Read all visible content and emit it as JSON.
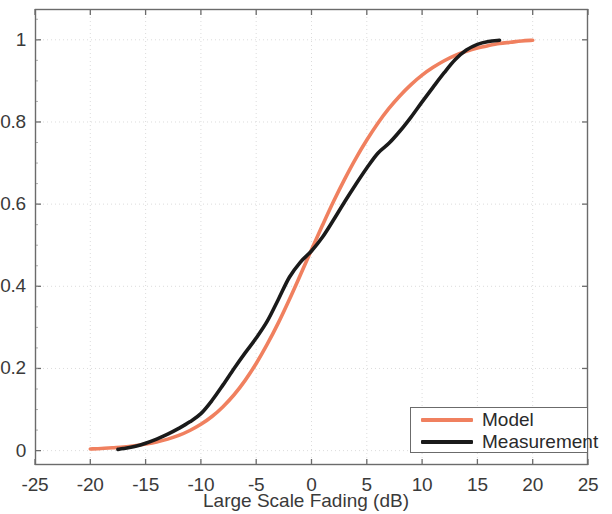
{
  "chart_data": {
    "type": "line",
    "title": "",
    "xlabel": "Large Scale Fading (dB)",
    "ylabel": "",
    "xlim": [
      -25,
      25
    ],
    "ylim": [
      -0.035,
      1.075
    ],
    "xticks": [
      -25,
      -20,
      -15,
      -10,
      -5,
      0,
      5,
      10,
      15,
      20,
      25
    ],
    "xtick_labels": [
      "-25",
      "-20",
      "-15",
      "-10",
      "-5",
      "0",
      "5",
      "10",
      "15",
      "20",
      "25"
    ],
    "yticks": [
      0,
      0.2,
      0.4,
      0.6,
      0.8,
      1
    ],
    "ytick_labels": [
      "0",
      "0.2",
      "0.4",
      "0.6",
      "0.8",
      "1"
    ],
    "grid": true,
    "grid_style": "dotted",
    "legend_position": "lower right",
    "series": [
      {
        "name": "Model",
        "color": "#f0805f",
        "width": 3.6,
        "x": [
          -20,
          -19,
          -18,
          -17,
          -16,
          -15,
          -14,
          -13,
          -12,
          -11,
          -10,
          -9,
          -8,
          -7,
          -6,
          -5,
          -4,
          -3,
          -2,
          -1,
          0,
          1,
          2,
          3,
          4,
          5,
          6,
          7,
          8,
          9,
          10,
          11,
          12,
          13,
          14,
          15,
          16,
          17,
          18,
          19,
          20
        ],
        "y": [
          0.004,
          0.005,
          0.007,
          0.009,
          0.012,
          0.016,
          0.021,
          0.028,
          0.037,
          0.049,
          0.064,
          0.083,
          0.107,
          0.136,
          0.171,
          0.212,
          0.259,
          0.311,
          0.368,
          0.428,
          0.489,
          0.549,
          0.607,
          0.661,
          0.711,
          0.756,
          0.797,
          0.833,
          0.864,
          0.891,
          0.914,
          0.933,
          0.949,
          0.962,
          0.972,
          0.98,
          0.986,
          0.991,
          0.994,
          0.997,
          0.999
        ]
      },
      {
        "name": "Measurement",
        "color": "#1a1a1a",
        "width": 3.6,
        "x": [
          -17.5,
          -17,
          -16,
          -15,
          -14,
          -13,
          -12,
          -11,
          -10,
          -9,
          -8,
          -7,
          -6,
          -5,
          -4,
          -3,
          -2,
          -1,
          0,
          1,
          2,
          3,
          4,
          5,
          6,
          7,
          8,
          9,
          10,
          11,
          12,
          13,
          14,
          15,
          16,
          17
        ],
        "y": [
          0.003,
          0.005,
          0.01,
          0.018,
          0.028,
          0.04,
          0.054,
          0.07,
          0.09,
          0.122,
          0.16,
          0.2,
          0.238,
          0.274,
          0.315,
          0.368,
          0.422,
          0.459,
          0.486,
          0.52,
          0.562,
          0.606,
          0.648,
          0.688,
          0.724,
          0.748,
          0.778,
          0.812,
          0.849,
          0.885,
          0.92,
          0.952,
          0.975,
          0.989,
          0.996,
          0.999
        ]
      }
    ]
  },
  "axes": {
    "xlabel": "Large Scale Fading (dB)",
    "xtick_labels": [
      "-25",
      "-20",
      "-15",
      "-10",
      "-5",
      "0",
      "5",
      "10",
      "15",
      "20",
      "25"
    ],
    "ytick_labels": [
      "0",
      "0.2",
      "0.4",
      "0.6",
      "0.8",
      "1"
    ]
  },
  "legend": {
    "entries": [
      {
        "label": "Model",
        "color": "#f0805f"
      },
      {
        "label": "Measurement",
        "color": "#1a1a1a"
      }
    ]
  },
  "colors": {
    "model": "#f0805f",
    "measurement": "#1a1a1a",
    "axis": "#6b6b6b",
    "text": "#3a3a3a",
    "grid": "#d8d8d8",
    "background": "#ffffff"
  }
}
